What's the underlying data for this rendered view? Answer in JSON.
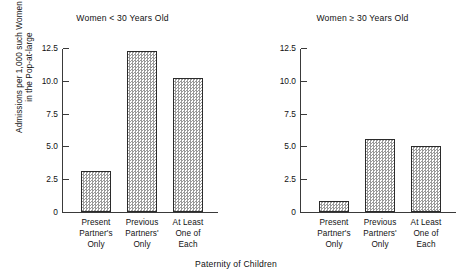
{
  "chart_data": {
    "type": "bar",
    "title": "",
    "xlabel": "Paternity of Children",
    "ylabel": "Admissions per 1,000 such Women in the Pop-at-large",
    "ylabel_line1": "Admissions per 1,000 such Women",
    "ylabel_line2": "in the Pop-at-large",
    "ylim": [
      0,
      12.5
    ],
    "yticks": [
      0,
      2.5,
      5.0,
      7.5,
      10.0,
      12.5
    ],
    "ytick_labels": [
      "0",
      "2.5",
      "5.0",
      "7.5",
      "10.0",
      "12.5"
    ],
    "grid": false,
    "legend": "none",
    "categories": [
      "Present Partner's Only",
      "Previous Partners' Only",
      "At Least One of Each"
    ],
    "category_lines": [
      [
        "Present",
        "Partner's",
        "Only"
      ],
      [
        "Previous",
        "Partners'",
        "Only"
      ],
      [
        "At Least",
        "One of",
        "Each"
      ]
    ],
    "panels": [
      {
        "title": "Women < 30 Years Old",
        "values": [
          3.1,
          12.3,
          10.2
        ]
      },
      {
        "title": "Women ≥ 30 Years Old",
        "values": [
          0.85,
          5.6,
          5.0
        ]
      }
    ],
    "bar_fill": "#9a9a9a",
    "bar_edge": "#2b2b2b",
    "axis_color": "#3a3a3a",
    "background": "#ffffff"
  }
}
